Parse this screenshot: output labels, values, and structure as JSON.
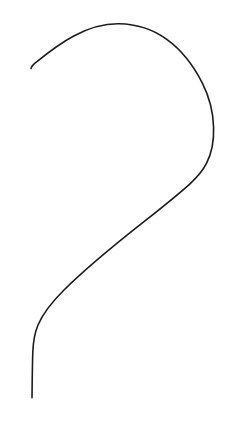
{
  "canvas": {
    "width": 231,
    "height": 430,
    "background_color": "#ffffff",
    "title": "hook-curve-line-drawing"
  },
  "drawing": {
    "description": "Single continuous hand-drawn stroke forming a large hook / question-mark-like curve",
    "stroke_color": "#1c1c1c",
    "stroke_width": 1.6,
    "stroke_linecap": "round",
    "fill": "none",
    "path_d": "M31.0,68.5 C31.8,65.6 34.0,63.8 36.6,61.9 C48.0,52.6 60.6,43.0 73.8,36.0 C89.4,27.6 105.0,23.6 119.0,23.8 C136.0,24.1 152.8,29.2 166.8,39.4 C182.0,50.4 193.8,66.0 202.6,83.6 C209.6,97.6 213.2,112.6 213.6,127.4 C214.0,141.0 211.6,153.2 206.6,163.2 C202.6,171.2 197.0,177.4 190.0,183.8 C176.0,196.4 160.0,209.0 144.0,221.6 C116.0,243.6 88.0,266.0 64.0,290.0 C52.0,302.0 43.0,313.0 38.0,325.0 C34.4,333.6 33.2,342.0 32.8,352.0 C32.4,364.0 32.2,380.0 32.0,397.8",
    "segments": [
      {
        "name": "left-tip-hook",
        "start": [
          31.0,
          68.5
        ],
        "end": [
          36.6,
          61.9
        ]
      },
      {
        "name": "upper-left-rising-arc",
        "start": [
          36.6,
          61.9
        ],
        "end": [
          119.0,
          23.8
        ]
      },
      {
        "name": "apex",
        "point": [
          118.0,
          23.8
        ]
      },
      {
        "name": "right-descending-arc",
        "start": [
          119.0,
          23.8
        ],
        "end": [
          213.6,
          127.4
        ]
      },
      {
        "name": "rightmost-extent",
        "point": [
          213.6,
          140.0
        ]
      },
      {
        "name": "inflection",
        "point": [
          206.0,
          178.0
        ]
      },
      {
        "name": "long-diagonal-tail",
        "start": [
          206.0,
          178.0
        ],
        "end": [
          32.0,
          397.8
        ]
      },
      {
        "name": "bottom-tip",
        "point": [
          32.0,
          397.8
        ]
      }
    ]
  }
}
